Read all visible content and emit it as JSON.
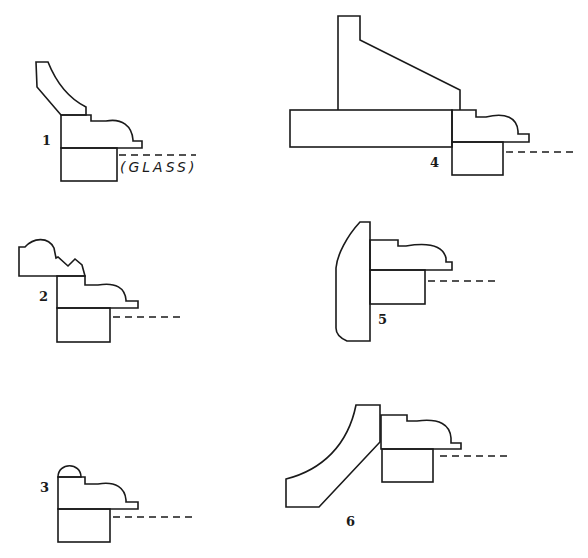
{
  "diagram": {
    "figures": [
      {
        "id": "1",
        "label": "1",
        "annotation": "(GLASS)",
        "parts": [
          "crown-molding",
          "sash-profile",
          "sash-bottom",
          "glass-line"
        ]
      },
      {
        "id": "2",
        "label": "2",
        "parts": [
          "ogee-crown",
          "sash-profile",
          "sash-bottom",
          "glass-line"
        ]
      },
      {
        "id": "3",
        "label": "3",
        "parts": [
          "bead",
          "sash-profile",
          "sash-bottom",
          "glass-line"
        ]
      },
      {
        "id": "4",
        "label": "4",
        "parts": [
          "backband",
          "plank",
          "sash-profile",
          "sash-bottom",
          "glass-line"
        ]
      },
      {
        "id": "5",
        "label": "5",
        "parts": [
          "casing",
          "sash-profile",
          "sash-bottom",
          "glass-line"
        ]
      },
      {
        "id": "6",
        "label": "6",
        "parts": [
          "cove-crown",
          "sash-profile",
          "sash-bottom",
          "glass-line"
        ]
      }
    ],
    "colors": {
      "line": "#1a1a1a",
      "background": "#ffffff"
    }
  }
}
